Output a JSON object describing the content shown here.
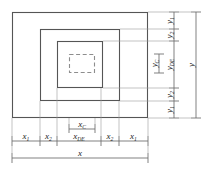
{
  "figure": {
    "type": "engineering-dimension-diagram",
    "line_color": "#4d4d4d",
    "dashed_color": "#8a8a8a",
    "text_color": "#1c1c1c",
    "background": "#ffffff"
  },
  "shapes": {
    "outer_rect": {
      "x": 12,
      "y": 12,
      "width": 136,
      "height": 106
    },
    "middle_rect": {
      "x": 40,
      "y": 29,
      "width": 80,
      "height": 72
    },
    "inner_rect": {
      "x": 57,
      "y": 41,
      "width": 46,
      "height": 47
    },
    "core_dashed_rect": {
      "x": 69,
      "y": 54,
      "width": 26,
      "height": 19
    }
  },
  "horizontal_dimensions": {
    "overall": {
      "label": "x",
      "sub": ""
    },
    "segments": [
      {
        "label": "x",
        "sub": "1",
        "from": 12,
        "to": 40
      },
      {
        "label": "x",
        "sub": "2",
        "from": 40,
        "to": 57
      },
      {
        "label": "x",
        "sub": "DE",
        "from": 57,
        "to": 101
      },
      {
        "label": "x",
        "sub": "2",
        "from": 101,
        "to": 119
      },
      {
        "label": "x",
        "sub": "1",
        "from": 119,
        "to": 148
      }
    ],
    "core": {
      "label": "x",
      "sub": "C",
      "from": 69,
      "to": 95
    }
  },
  "vertical_dimensions": {
    "overall": {
      "label": "y",
      "sub": ""
    },
    "segments": [
      {
        "label": "y",
        "sub": "1",
        "from": 12,
        "to": 29
      },
      {
        "label": "y",
        "sub": "2",
        "from": 29,
        "to": 41
      },
      {
        "label": "y",
        "sub": "DE",
        "from": 41,
        "to": 88
      },
      {
        "label": "y",
        "sub": "2",
        "from": 88,
        "to": 101
      },
      {
        "label": "y",
        "sub": "1",
        "from": 101,
        "to": 118
      }
    ],
    "core": {
      "label": "y",
      "sub": "C",
      "from": 54,
      "to": 73
    }
  }
}
